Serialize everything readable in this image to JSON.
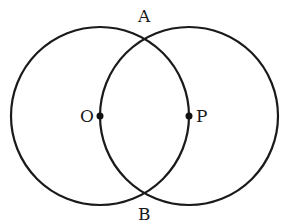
{
  "diagram": {
    "type": "two intersecting circles",
    "stroke_color": "#1a1a1a",
    "background": "#ffffff",
    "circles": [
      {
        "name": "circle-O",
        "center_label": "O",
        "cx": 100,
        "cy": 116,
        "r": 89
      },
      {
        "name": "circle-P",
        "center_label": "P",
        "cx": 189,
        "cy": 116,
        "r": 89
      }
    ],
    "points": [
      {
        "label": "O",
        "x": 100,
        "y": 116,
        "label_x": 82,
        "label_y": 122
      },
      {
        "label": "P",
        "x": 189,
        "y": 116,
        "label_x": 196,
        "label_y": 122
      },
      {
        "label": "A",
        "x": 144.5,
        "y": 38,
        "label_x": 137,
        "label_y": 22
      },
      {
        "label": "B",
        "x": 144.5,
        "y": 194,
        "label_x": 137,
        "label_y": 220
      }
    ]
  }
}
